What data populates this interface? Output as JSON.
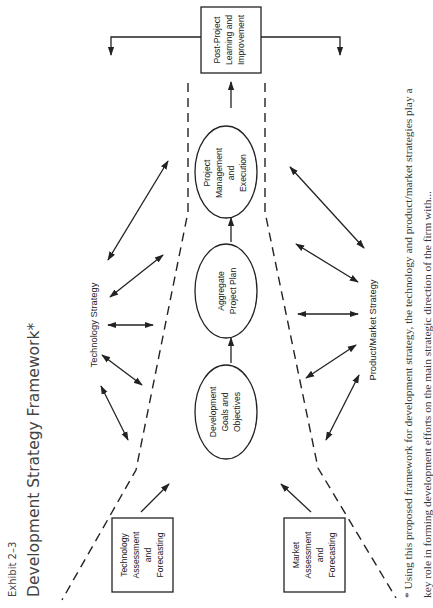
{
  "exhibit": {
    "label": "Exhibit 2–3",
    "title": "Development Strategy Framework*"
  },
  "nodes": {
    "post_project": [
      "Post-Project",
      "Learning and",
      "Improvement"
    ],
    "project_management": [
      "Project",
      "Management",
      "and",
      "Execution"
    ],
    "aggregate_plan": [
      "Aggregate",
      "Project Plan"
    ],
    "development_goals": [
      "Development",
      "Goals and",
      "Objectives"
    ],
    "technology_assessment": [
      "Technology",
      "Assessment",
      "and",
      "Forecasting"
    ],
    "market_assessment": [
      "Market",
      "Assessment",
      "and",
      "Forecasting"
    ]
  },
  "strategies": {
    "technology": "Technology Strategy",
    "product_market": "Product/Market Strategy"
  },
  "footnote": {
    "line1": "* Using this proposed framework for development strategy, the technology and product/market strategies play a",
    "line2": "key role in forming development efforts on the main strategic direction of the firm with..."
  },
  "colors": {
    "ink": "#222222",
    "title": "#444444",
    "background": "#ffffff"
  }
}
